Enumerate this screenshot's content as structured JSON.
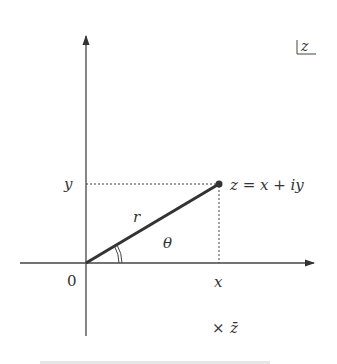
{
  "diagram": {
    "plane_label": "z",
    "origin_label": "0",
    "x_label": "x",
    "y_label": "y",
    "point_label": "z = x + iy",
    "radius_label": "r",
    "angle_label": "θ",
    "conjugate_label": "z̄",
    "conjugate_marker": "×",
    "colors": {
      "ink": "#333333",
      "background": "#ffffff"
    },
    "geometry": {
      "origin": [
        86,
        263
      ],
      "point_z": [
        219,
        184
      ],
      "conjugate_marker_pos": [
        249,
        328
      ],
      "x_axis": {
        "from": 20,
        "to": 316
      },
      "y_axis": {
        "from": 336,
        "to": 33
      }
    }
  }
}
